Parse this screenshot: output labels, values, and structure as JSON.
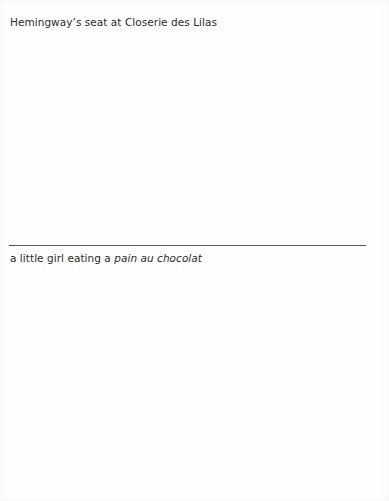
{
  "photo_captions": {
    "top": {
      "text": "Hemingway’s seat at Closerie des Lilas"
    },
    "bottom": {
      "text_prefix": "a little girl eating a ",
      "text_italic": "pain au chocolat"
    }
  },
  "divider": {
    "color": "#5a5a5a"
  }
}
